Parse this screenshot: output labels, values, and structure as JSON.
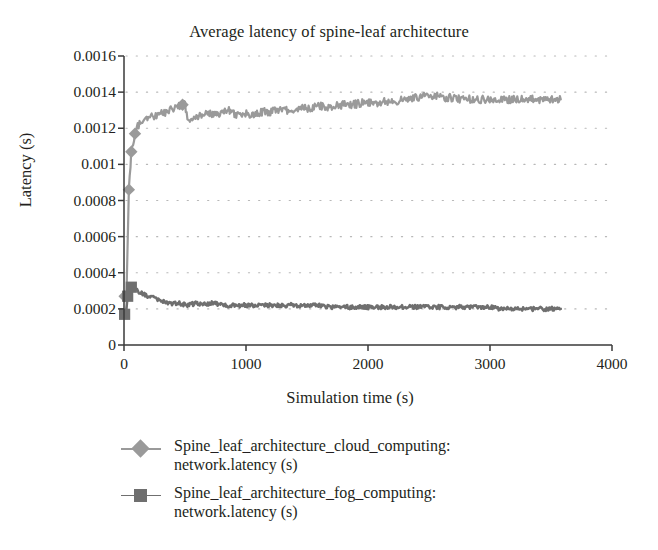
{
  "chart_data": {
    "type": "line",
    "title": "Average latency of spine-leaf architecture",
    "xlabel": "Simulation time (s)",
    "ylabel": "Latency (s)",
    "xlim": [
      0,
      4000
    ],
    "ylim": [
      0,
      0.0016
    ],
    "xticks": [
      "0",
      "1000",
      "2000",
      "3000",
      "4000"
    ],
    "xtick_values": [
      0,
      1000,
      2000,
      3000,
      4000
    ],
    "yticks": [
      "0",
      "0.0002",
      "0.0004",
      "0.0006",
      "0.0008",
      "0.001",
      "0.0012",
      "0.0014",
      "0.0016"
    ],
    "ytick_values": [
      0,
      0.0002,
      0.0004,
      0.0006,
      0.0008,
      0.001,
      0.0012,
      0.0014,
      0.0016
    ],
    "grid": "horizontal-dotted",
    "legend_position": "bottom-left",
    "series": [
      {
        "name": "Spine_leaf_architecture_cloud_computing: network.latency (s)",
        "label_line1": "Spine_leaf_architecture_cloud_computing:",
        "label_line2": "network.latency (s)",
        "color": "#9a9a9a",
        "marker": "diamond",
        "x": [
          5,
          20,
          40,
          60,
          90,
          120,
          150,
          185,
          220,
          260,
          300,
          345,
          390,
          435,
          480,
          500,
          520,
          560,
          600,
          650,
          700,
          760,
          820,
          880,
          900,
          905,
          920,
          960,
          1010,
          1070,
          1130,
          1200,
          1280,
          1360,
          1440,
          1520,
          1600,
          1690,
          1780,
          1870,
          1960,
          2050,
          2140,
          2230,
          2320,
          2410,
          2500,
          2560,
          2620,
          2700,
          2780,
          2860,
          2940,
          3020,
          3100,
          3180,
          3260,
          3340,
          3420,
          3500,
          3580
        ],
        "y": [
          0.00027,
          0.00027,
          0.00086,
          0.00107,
          0.00117,
          0.00122,
          0.00124,
          0.00125,
          0.00126,
          0.00127,
          0.00128,
          0.00129,
          0.00131,
          0.00132,
          0.00133,
          0.00133,
          0.00125,
          0.00126,
          0.00127,
          0.00127,
          0.00128,
          0.00128,
          0.00129,
          0.0013,
          0.00131,
          0.00127,
          0.00127,
          0.00128,
          0.00128,
          0.00128,
          0.00129,
          0.00129,
          0.0013,
          0.0013,
          0.00131,
          0.00131,
          0.00132,
          0.00132,
          0.00133,
          0.00133,
          0.00134,
          0.00134,
          0.00135,
          0.00135,
          0.00136,
          0.00137,
          0.00138,
          0.00138,
          0.00137,
          0.00137,
          0.00136,
          0.00136,
          0.00136,
          0.00136,
          0.00136,
          0.00136,
          0.00136,
          0.00136,
          0.00136,
          0.00136,
          0.00136
        ]
      },
      {
        "name": "Spine_leaf_architecture_fog_computing: network.latency (s)",
        "label_line1": "Spine_leaf_architecture_fog_computing:",
        "label_line2": "network.latency (s)",
        "color": "#6f6f6f",
        "marker": "square",
        "x": [
          5,
          15,
          30,
          45,
          60,
          80,
          100,
          130,
          160,
          200,
          240,
          290,
          340,
          400,
          460,
          520,
          580,
          640,
          700,
          760,
          830,
          900,
          970,
          1040,
          1110,
          1180,
          1260,
          1340,
          1420,
          1500,
          1580,
          1670,
          1760,
          1850,
          1940,
          2030,
          2120,
          2210,
          2300,
          2400,
          2500,
          2600,
          2700,
          2800,
          2900,
          3000,
          3100,
          3200,
          3300,
          3400,
          3500,
          3580
        ],
        "y": [
          0.00017,
          0.00017,
          0.00027,
          0.0003,
          0.00032,
          0.00032,
          0.00031,
          0.00029,
          0.00028,
          0.00027,
          0.00026,
          0.00025,
          0.00024,
          0.00023,
          0.00023,
          0.00022,
          0.00023,
          0.00023,
          0.00023,
          0.00023,
          0.00022,
          0.00022,
          0.00022,
          0.00022,
          0.00022,
          0.00022,
          0.00022,
          0.00022,
          0.00022,
          0.00022,
          0.00022,
          0.00021,
          0.00021,
          0.00021,
          0.00021,
          0.00021,
          0.00021,
          0.00021,
          0.00021,
          0.00021,
          0.00021,
          0.00021,
          0.00021,
          0.00021,
          0.00021,
          0.00021,
          0.0002,
          0.0002,
          0.0002,
          0.0002,
          0.0002,
          0.0002
        ]
      }
    ],
    "colors": {
      "cloud_series": "#9a9a9a",
      "fog_series": "#6f6f6f",
      "axis": "#3a3a3a",
      "grid": "#b8b8b8",
      "text": "#231f20",
      "background": "#ffffff"
    }
  }
}
